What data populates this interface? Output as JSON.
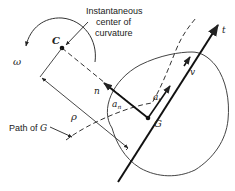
{
  "diagram": {
    "labels": {
      "center_title_line1": "Instantaneous",
      "center_title_line2": "center of",
      "center_title_line3": "curvature",
      "C": "C",
      "omega": "ω",
      "n": "n",
      "a_n": "a",
      "a_n_sub": "n",
      "a_t": "a",
      "a_t_sub": "t",
      "v": "v",
      "t": "t",
      "G": "G",
      "rho": "ρ",
      "path_label": "Path of ",
      "path_label_G": "G"
    },
    "colors": {
      "ink": "#222222",
      "background": "#ffffff"
    }
  }
}
